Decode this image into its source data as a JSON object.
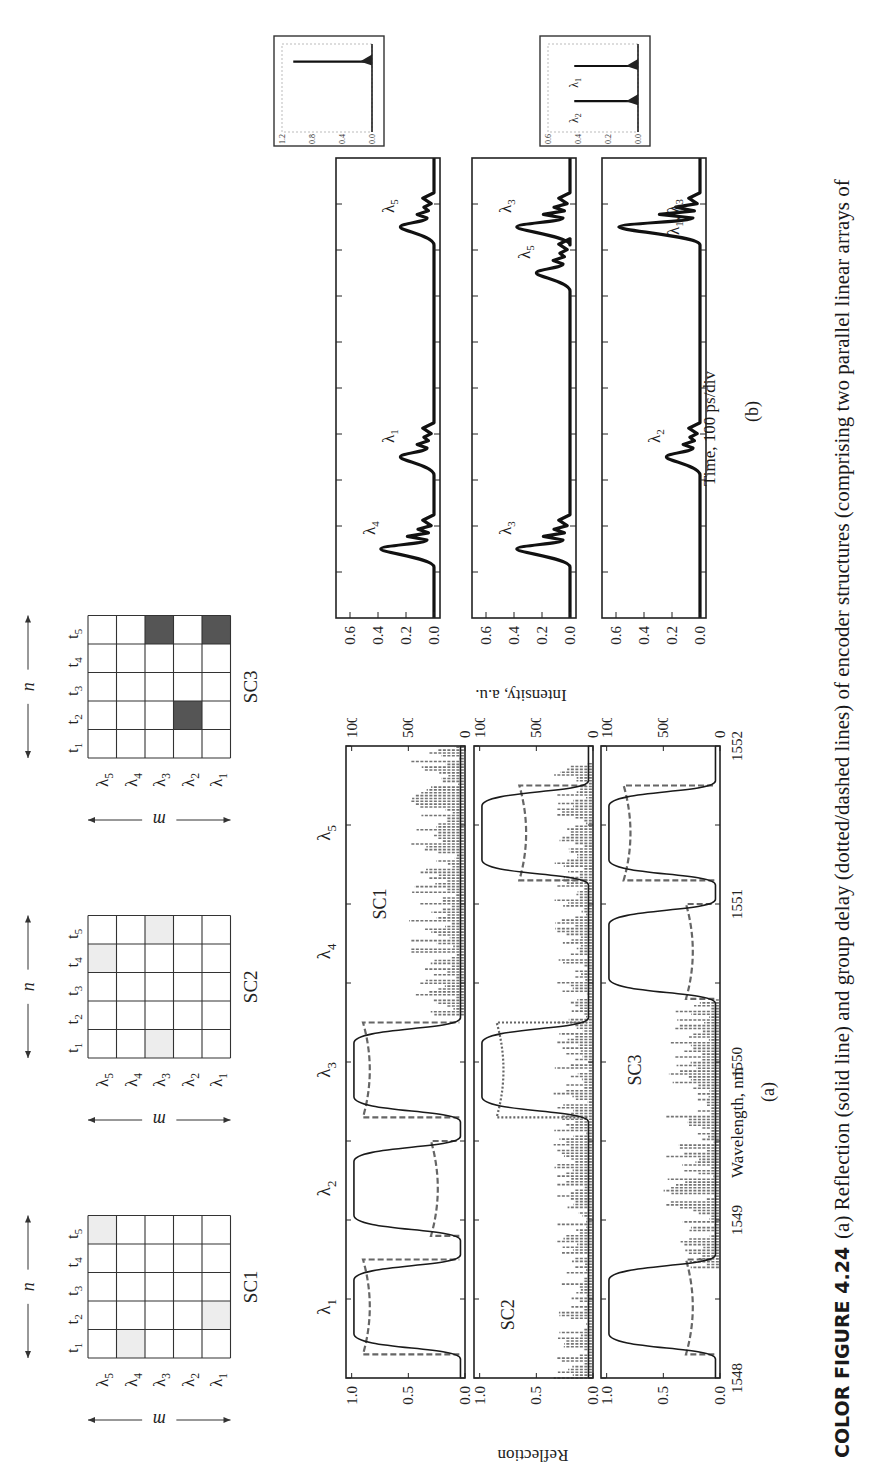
{
  "caption": {
    "lead": "COLOR FIGURE 4.24",
    "text": "(a) Reflection (solid line) and group delay (dotted/dashed lines) of encoder structures (comprising two parallel linear arrays of"
  },
  "matrices": {
    "axis_m_label": "m",
    "axis_n_label": "n",
    "row_labels": [
      "λ5",
      "λ4",
      "λ3",
      "λ2",
      "λ1"
    ],
    "col_labels": [
      "t1",
      "t2",
      "t3",
      "t4",
      "t5"
    ],
    "light_fill": "#ededed",
    "dark_fill": "#555555",
    "items": [
      {
        "name": "SC1",
        "fill": "light",
        "cells": [
          [
            "λ5",
            "t5"
          ],
          [
            "λ4",
            "t1"
          ],
          [
            "λ1",
            "t2"
          ]
        ]
      },
      {
        "name": "SC2",
        "fill": "light",
        "cells": [
          [
            "λ5",
            "t4"
          ],
          [
            "λ3",
            "t1"
          ],
          [
            "λ3",
            "t5"
          ]
        ]
      },
      {
        "name": "SC3",
        "fill": "dark",
        "cells": [
          [
            "λ3",
            "t5"
          ],
          [
            "λ2",
            "t2"
          ],
          [
            "λ1",
            "t5"
          ]
        ]
      }
    ]
  },
  "panel_a": {
    "label": "(a)",
    "xlabel": "Wavelength, nm",
    "ylabel_left": "Reflection",
    "ylabel_right": "Group delay, ps",
    "top_lambda_labels": [
      "λ1",
      "λ2",
      "λ3",
      "λ4",
      "λ5"
    ]
  },
  "panel_b": {
    "label": "(b)",
    "xlabel": "Time, 100 ps/div",
    "ylabel": "Intensity, a.u."
  },
  "chart_data": [
    {
      "type": "line",
      "title": "SC1 reflection and group delay",
      "panel": "a-1",
      "xlabel": "Wavelength, nm",
      "ylabel": "Reflection",
      "y2label": "Group delay, ps",
      "xlim": [
        1548,
        1552
      ],
      "ylim": [
        0,
        1.05
      ],
      "y2lim": [
        0,
        1050
      ],
      "xticks": [
        1548,
        1549,
        1550,
        1551,
        1552
      ],
      "yticks": [
        "0.0",
        "0.5",
        "1.0"
      ],
      "y2ticks": [
        "0",
        "500",
        "1000"
      ],
      "annotation": "SC1",
      "series": [
        {
          "name": "Reflection",
          "style": "solid",
          "bands": [
            [
              1548.2,
              1548.7
            ],
            [
              1548.95,
              1549.45
            ],
            [
              1549.7,
              1550.2
            ]
          ],
          "peak": 1.0
        },
        {
          "name": "Group delay",
          "style": "dashed",
          "bands": [
            [
              1548.15,
              1548.75,
              900
            ],
            [
              1548.9,
              1549.5,
              300
            ],
            [
              1549.65,
              1550.25,
              900
            ]
          ],
          "noise_region": [
            1550.3,
            1552
          ]
        }
      ]
    },
    {
      "type": "line",
      "title": "SC2 reflection and group delay",
      "panel": "a-2",
      "xlim": [
        1548,
        1552
      ],
      "ylim": [
        0,
        1.05
      ],
      "y2lim": [
        0,
        1050
      ],
      "xticks": [
        1548,
        1549,
        1550,
        1551,
        1552
      ],
      "yticks": [
        "0.0",
        "0.5",
        "1.0"
      ],
      "y2ticks": [
        "0",
        "500",
        "1000"
      ],
      "annotation": "SC2",
      "series": [
        {
          "name": "Reflection",
          "style": "solid",
          "bands": [
            [
              1549.7,
              1550.2
            ],
            [
              1551.2,
              1551.7
            ]
          ],
          "peak": 1.0
        },
        {
          "name": "Group delay",
          "style": "dotted/dashed",
          "bands": [
            [
              1549.65,
              1550.25,
              850
            ],
            [
              1551.15,
              1551.75,
              650
            ]
          ],
          "noise_region": [
            1548,
            1551.9
          ]
        }
      ]
    },
    {
      "type": "line",
      "title": "SC3 reflection and group delay",
      "panel": "a-3",
      "xlim": [
        1548,
        1552
      ],
      "ylim": [
        0,
        1.05
      ],
      "y2lim": [
        0,
        1050
      ],
      "xticks": [
        1548,
        1549,
        1550,
        1551,
        1552
      ],
      "yticks": [
        "0.0",
        "0.5",
        "1.0"
      ],
      "y2ticks": [
        "0",
        "500",
        "1000"
      ],
      "annotation": "SC3",
      "series": [
        {
          "name": "Reflection",
          "style": "solid",
          "bands": [
            [
              1548.2,
              1548.7
            ],
            [
              1550.45,
              1550.95
            ],
            [
              1551.2,
              1551.7
            ]
          ],
          "peak": 1.0
        },
        {
          "name": "Group delay",
          "style": "dashed",
          "bands": [
            [
              1548.15,
              1548.75,
              300
            ],
            [
              1550.4,
              1551.0,
              300
            ],
            [
              1551.15,
              1551.75,
              850
            ]
          ],
          "noise_region": [
            1548.7,
            1550.4
          ]
        }
      ]
    },
    {
      "type": "line",
      "title": "SC1 decoded output",
      "panel": "b-1",
      "xlabel": "Time, 100 ps/div",
      "ylabel": "Intensity, a.u.",
      "ylim": [
        0,
        0.7
      ],
      "yticks": [
        "0.0",
        "0.2",
        "0.4",
        "0.6"
      ],
      "x_divisions": 10,
      "pulses": [
        {
          "label": "λ4",
          "t": 1.5,
          "peak": 0.38
        },
        {
          "label": "λ1",
          "t": 3.5,
          "peak": 0.24
        },
        {
          "label": "λ5",
          "t": 8.5,
          "peak": 0.24
        }
      ],
      "inset": {
        "yticks": [
          "0.0",
          "0.4",
          "0.8",
          "1.2"
        ],
        "peak": 1.05,
        "t": 0.8
      }
    },
    {
      "type": "line",
      "title": "SC2 decoded output",
      "panel": "b-2",
      "ylim": [
        0,
        0.7
      ],
      "yticks": [
        "0.0",
        "0.2",
        "0.4",
        "0.6"
      ],
      "x_divisions": 10,
      "pulses": [
        {
          "label": "λ3",
          "t": 1.5,
          "peak": 0.38
        },
        {
          "label": "λ5",
          "t": 7.5,
          "peak": 0.24
        },
        {
          "label": "λ3",
          "t": 8.5,
          "peak": 0.38
        }
      ]
    },
    {
      "type": "line",
      "title": "SC3 decoded output",
      "panel": "b-3",
      "ylim": [
        0,
        0.7
      ],
      "yticks": [
        "0.0",
        "0.2",
        "0.4",
        "0.6"
      ],
      "x_divisions": 10,
      "pulses": [
        {
          "label": "λ2",
          "t": 3.5,
          "peak": 0.24
        },
        {
          "label": "λ1, λ3",
          "t": 8.5,
          "peak": 0.58
        }
      ],
      "inset": {
        "yticks": [
          "0.0",
          "0.2",
          "0.4",
          "0.6"
        ],
        "labels": [
          "λ2",
          "λ1"
        ],
        "peaks": [
          0.5,
          0.5
        ],
        "t": [
          0.35,
          0.75
        ]
      }
    }
  ]
}
